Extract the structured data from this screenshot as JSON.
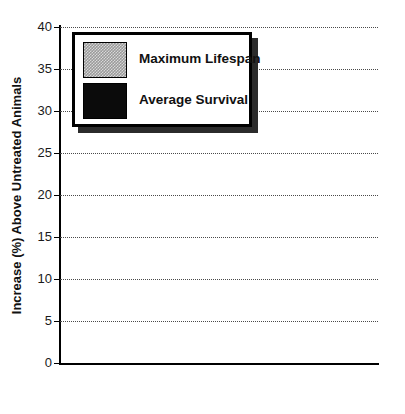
{
  "chart_data": {
    "type": "bar",
    "title": "",
    "xlabel": "",
    "ylabel": "Increase (%) Above Untreated Animals",
    "ylim": [
      0,
      40
    ],
    "ytick_labels": [
      "0",
      "5",
      "10",
      "15",
      "20",
      "25",
      "30",
      "35",
      "40"
    ],
    "yticks": [
      0,
      5,
      10,
      15,
      20,
      25,
      30,
      35,
      40
    ],
    "grid": "horizontal-dotted",
    "legend_position": "upper-left-inside",
    "categories": [
      "Ethoxyquin",
      "Centrophenoxine",
      "Deprenyl"
    ],
    "series": [
      {
        "name": "Average Survival",
        "values": [
          19,
          17,
          33
        ],
        "color": "#0b0b0b",
        "fill": "solid-black"
      },
      {
        "name": "Maximum Lifespan",
        "values": [
          25,
          27,
          38
        ],
        "color": "#9a9a9a",
        "fill": "gray-checker"
      }
    ],
    "legend_order": [
      "Maximum Lifespan",
      "Average Survival"
    ],
    "bar_order_within_group": [
      "Average Survival",
      "Maximum Lifespan"
    ]
  },
  "axis": {
    "y_title": "Increase (%) Above Untreated Animals",
    "y_values": [
      "40",
      "35",
      "30",
      "25",
      "20",
      "15",
      "10",
      "5",
      "0"
    ]
  },
  "legend": {
    "entries": [
      {
        "label": "Maximum Lifespan"
      },
      {
        "label": "Average Survival"
      }
    ]
  },
  "categories": [
    {
      "label": "Ethoxyquin"
    },
    {
      "label": "Centrophenoxine"
    },
    {
      "label": "Deprenyl"
    }
  ],
  "title_sliver": {
    "text": ""
  }
}
